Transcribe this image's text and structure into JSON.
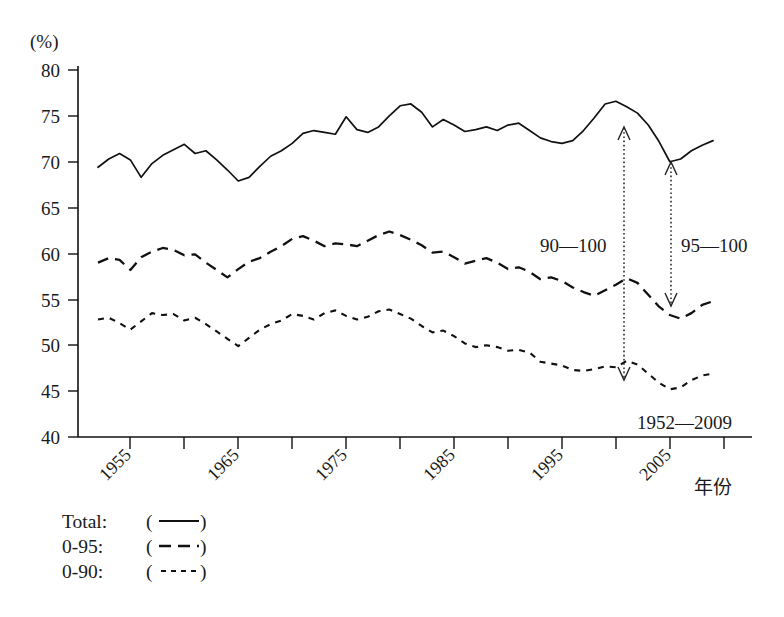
{
  "chart_data": {
    "type": "line",
    "title": "",
    "subtitle": "",
    "xlabel": "年份",
    "ylabel": "(%)",
    "ylim": [
      40,
      80
    ],
    "xlim": [
      1952,
      2009
    ],
    "grid": false,
    "legend_position": "below-left",
    "range_note": "1952—2009",
    "yticks": [
      40,
      45,
      50,
      55,
      60,
      65,
      70,
      75,
      80
    ],
    "xticks": [
      1955,
      1960,
      1965,
      1970,
      1975,
      1980,
      1985,
      1990,
      1995,
      2000,
      2005
    ],
    "xtick_labels": [
      "1955",
      "",
      "1965",
      "",
      "1975",
      "",
      "1985",
      "",
      "1995",
      "",
      "2005"
    ],
    "xtick_label_rotation": 45,
    "x": [
      1952,
      1953,
      1954,
      1955,
      1956,
      1957,
      1958,
      1959,
      1960,
      1961,
      1962,
      1963,
      1964,
      1965,
      1966,
      1967,
      1968,
      1969,
      1970,
      1971,
      1972,
      1973,
      1974,
      1975,
      1976,
      1977,
      1978,
      1979,
      1980,
      1981,
      1982,
      1983,
      1984,
      1985,
      1986,
      1987,
      1988,
      1989,
      1990,
      1991,
      1992,
      1993,
      1994,
      1995,
      1996,
      1997,
      1998,
      1999,
      2000,
      2001,
      2002,
      2003,
      2004,
      2005,
      2006,
      2007,
      2008,
      2009
    ],
    "series": [
      {
        "name": "Total",
        "label": "Total:",
        "style": "solid",
        "values": [
          69.4,
          70.3,
          70.9,
          70.2,
          68.3,
          69.8,
          70.7,
          71.3,
          71.9,
          70.9,
          71.2,
          70.2,
          69.1,
          67.9,
          68.3,
          69.5,
          70.6,
          71.2,
          72.0,
          73.1,
          73.4,
          73.2,
          73.0,
          74.9,
          73.5,
          73.2,
          73.8,
          75.0,
          76.1,
          76.3,
          75.4,
          73.8,
          74.6,
          74.0,
          73.3,
          73.5,
          73.8,
          73.4,
          74.0,
          74.2,
          73.4,
          72.6,
          72.2,
          72.0,
          72.3,
          73.4,
          74.8,
          76.3,
          76.6,
          76.0,
          75.3,
          74.0,
          72.2,
          70.0,
          70.3,
          71.2,
          71.8,
          72.3
        ]
      },
      {
        "name": "0-95",
        "label": "0-95:",
        "style": "dashed",
        "values": [
          59.0,
          59.5,
          59.3,
          58.2,
          59.6,
          60.2,
          60.6,
          60.4,
          59.8,
          59.9,
          59.0,
          58.2,
          57.4,
          58.3,
          59.1,
          59.5,
          60.2,
          60.8,
          61.6,
          61.9,
          61.4,
          60.8,
          61.1,
          61.0,
          60.8,
          61.4,
          62.0,
          62.4,
          62.0,
          61.5,
          60.9,
          60.1,
          60.2,
          59.6,
          58.9,
          59.2,
          59.5,
          59.0,
          58.3,
          58.5,
          58.0,
          57.2,
          57.4,
          57.0,
          56.3,
          55.8,
          55.4,
          56.0,
          56.6,
          57.3,
          56.8,
          55.5,
          54.2,
          53.3,
          52.9,
          53.5,
          54.4,
          54.8
        ]
      },
      {
        "name": "0-90",
        "label": "0-90:",
        "style": "dotted",
        "values": [
          52.8,
          53.0,
          52.4,
          51.7,
          52.6,
          53.5,
          53.3,
          53.4,
          52.7,
          53.0,
          52.3,
          51.5,
          50.7,
          49.9,
          50.8,
          51.7,
          52.3,
          52.7,
          53.4,
          53.2,
          52.8,
          53.5,
          53.8,
          53.2,
          52.8,
          53.1,
          53.7,
          53.9,
          53.4,
          52.9,
          52.1,
          51.4,
          51.6,
          51.0,
          50.2,
          49.8,
          50.0,
          49.8,
          49.4,
          49.5,
          49.2,
          48.2,
          48.0,
          47.8,
          47.3,
          47.2,
          47.4,
          47.7,
          47.6,
          48.3,
          47.9,
          46.9,
          45.9,
          45.2,
          45.4,
          46.2,
          46.7,
          46.9
        ]
      }
    ],
    "annotations": [
      {
        "text": "90—100",
        "x": 2000,
        "note": "arrow from Total down to 0-90"
      },
      {
        "text": "95—100",
        "x": 2005,
        "note": "arrow from Total down to 0-95"
      },
      {
        "text": "1952—2009",
        "x": 2003,
        "note": "period label"
      }
    ]
  },
  "legend": {
    "items": [
      {
        "label": "Total:",
        "sample": "(——)",
        "style": "solid"
      },
      {
        "label": "0-95:",
        "sample": "(— —)",
        "style": "dashed"
      },
      {
        "label": "0-90:",
        "sample": "(-----)",
        "style": "dotted"
      }
    ],
    "open_paren": "(",
    "close_paren": ")"
  },
  "axes": {
    "y_unit": "(%)",
    "x_title": "年份"
  }
}
